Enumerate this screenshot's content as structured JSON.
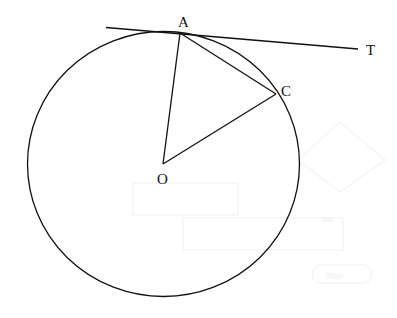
{
  "diagram": {
    "type": "geometry",
    "colors": {
      "stroke": "#111111",
      "background": "#ffffff",
      "ghost": "#ececec"
    },
    "circle": {
      "cx": 163,
      "cy": 164,
      "r": 134
    },
    "points": {
      "O": {
        "label": "O",
        "x": 163,
        "y": 164
      },
      "A": {
        "label": "A",
        "x": 180,
        "y": 32
      },
      "C": {
        "label": "C",
        "x": 276,
        "y": 95
      },
      "T": {
        "label": "T",
        "x": 358,
        "y": 49
      }
    },
    "segments": [
      {
        "from": "O",
        "to": "A",
        "name": "radius-OA"
      },
      {
        "from": "O",
        "to": "C",
        "name": "radius-OC"
      },
      {
        "from": "A",
        "to": "C",
        "name": "chord-AC"
      }
    ],
    "tangent": {
      "x1": 106,
      "y1": 27,
      "x2": 358,
      "y2": 49,
      "label": "T"
    }
  },
  "labels": {
    "A": "A",
    "C": "C",
    "O": "O",
    "T": "T"
  },
  "ghost_text": {
    "stop": "Stop",
    "go": "Go"
  }
}
